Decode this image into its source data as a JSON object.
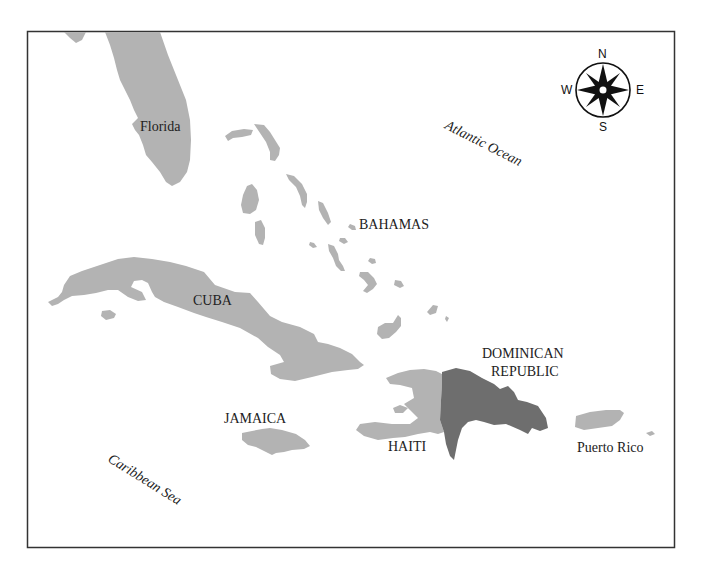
{
  "map": {
    "colors": {
      "land": "#b3b3b3",
      "dominican_republic": "#6e6e6e",
      "water": "#ffffff",
      "frame": "#333333",
      "text": "#222222"
    },
    "labels": {
      "florida": "Florida",
      "atlantic": "Atlantic Ocean",
      "bahamas": "BAHAMAS",
      "cuba": "CUBA",
      "dominican_line1": "DOMINICAN",
      "dominican_line2": "REPUBLIC",
      "jamaica": "JAMAICA",
      "haiti": "HAITI",
      "puerto_rico": "Puerto Rico",
      "caribbean": "Caribbean Sea"
    },
    "compass": {
      "icon": "compass-rose-icon",
      "north": "N",
      "south": "S",
      "east": "E",
      "west": "W"
    }
  }
}
